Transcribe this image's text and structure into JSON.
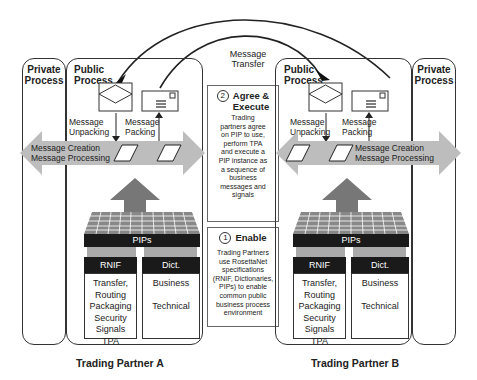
{
  "diagram": {
    "message_transfer": "Message\nTransfer",
    "partners": [
      {
        "name": "Trading Partner A",
        "private_process": "Private\nProcess",
        "public_process": "Public\nProcess",
        "unpacking": "Message\nUnpacking",
        "packing": "Message\nPacking",
        "creation": "Message Creation\nMessage Processing",
        "pips": "PIPs",
        "rnif": {
          "title": "RNIF",
          "items": "Transfer,\nRouting\nPackaging\nSecurity\nSignals\nTPA"
        },
        "dict": {
          "title": "Dict.",
          "items": "Business\n\nTechnical"
        }
      },
      {
        "name": "Trading Partner B",
        "private_process": "Private\nProcess",
        "public_process": "Public\nProcess",
        "unpacking": "Message\nUnpacking",
        "packing": "Message\nPacking",
        "creation": "Message Creation\nMessage Processing",
        "pips": "PIPs",
        "rnif": {
          "title": "RNIF",
          "items": "Transfer,\nRouting\nPackaging\nSecurity\nSignals\nTPA"
        },
        "dict": {
          "title": "Dict.",
          "items": "Business\n\nTechnical"
        }
      }
    ],
    "steps": [
      {
        "number": "2",
        "title": "Agree &\nExecute",
        "text": "Trading\npartners agree\non PIP to use,\nperform TPA\nand execute a\nPIP instance as\na sequence of\nbusiness\nmessages and\nsignals"
      },
      {
        "number": "1",
        "title": "Enable",
        "text": "Trading Partners\nuse RosettaNet\nspecifications\n(RNIF, Dictionaries,\nPIPs) to enable\ncommon public\nbusiness process\nenvironment"
      }
    ]
  }
}
